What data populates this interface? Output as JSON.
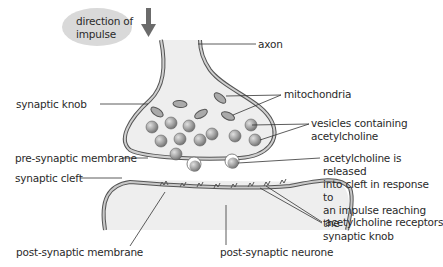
{
  "diagram": {
    "direction_bubble": {
      "line1": "direction of",
      "line2": "impulse"
    },
    "labels": {
      "axon": "axon",
      "mitochondria": "mitochondria",
      "synaptic_knob": "synaptic knob",
      "vesicles_line1": "vesicles containing",
      "vesicles_line2": "acetylcholine",
      "pre_synaptic_membrane": "pre-synaptic membrane",
      "synaptic_cleft": "synaptic cleft",
      "release_line1": "acetylcholine is released",
      "release_line2": "into cleft in response to",
      "release_line3": "an impulse reaching the",
      "release_line4": "synaptic knob",
      "receptors": "acetylcholine receptors",
      "post_synaptic_membrane": "post-synaptic membrane",
      "post_synaptic_neurone": "post-synaptic neurone"
    },
    "colors": {
      "membrane_fill": "#c9c9c9",
      "membrane_stroke": "#555555",
      "cytoplasm": "#eeeeee",
      "vesicle": "#9a9a9a",
      "bubble": "#d9d9d9",
      "arrow": "#6b6b6b",
      "leader": "#333333"
    }
  }
}
